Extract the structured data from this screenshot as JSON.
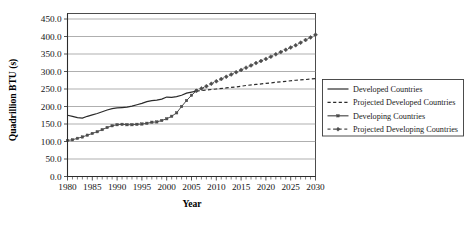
{
  "chart_data": {
    "type": "line",
    "title": "",
    "xlabel": "Year",
    "ylabel": "Quadrillion BTU (s)",
    "xlim": [
      1980,
      2030
    ],
    "ylim": [
      0,
      450
    ],
    "ytick_step": 50,
    "xtick_step": 5,
    "grid": true,
    "minor_xticks": true,
    "legend_position": "right",
    "xticks": [
      "1980",
      "1985",
      "1990",
      "1995",
      "2000",
      "2005",
      "2010",
      "2015",
      "2020",
      "2025",
      "2030"
    ],
    "yticks": [
      "0.0",
      "50.0",
      "100.0",
      "150.0",
      "200.0",
      "250.0",
      "300.0",
      "350.0",
      "400.0",
      "450.0"
    ],
    "series": [
      {
        "name": "Developed Countries",
        "style": "solid",
        "marker": "none",
        "color": "#2b2b2b",
        "x": [
          1980,
          1981,
          1982,
          1983,
          1984,
          1985,
          1986,
          1987,
          1988,
          1989,
          1990,
          1991,
          1992,
          1993,
          1994,
          1995,
          1996,
          1997,
          1998,
          1999,
          2000,
          2001,
          2002,
          2003,
          2004,
          2005,
          2006
        ],
        "values": [
          175,
          172,
          168,
          167,
          172,
          176,
          180,
          185,
          190,
          194,
          196,
          197,
          198,
          201,
          205,
          209,
          214,
          217,
          218,
          221,
          227,
          226,
          228,
          232,
          238,
          241,
          244
        ]
      },
      {
        "name": "Projected Developed Countries",
        "style": "dashed",
        "marker": "none",
        "color": "#2b2b2b",
        "x": [
          2006,
          2008,
          2010,
          2012,
          2014,
          2016,
          2018,
          2020,
          2022,
          2024,
          2026,
          2028,
          2030
        ],
        "values": [
          244,
          247,
          250,
          253,
          256,
          260,
          263,
          266,
          269,
          272,
          275,
          277,
          280
        ]
      },
      {
        "name": "Developing Countries",
        "style": "solid",
        "marker": "square",
        "color": "#4d4d4d",
        "x": [
          1980,
          1981,
          1982,
          1983,
          1984,
          1985,
          1986,
          1987,
          1988,
          1989,
          1990,
          1991,
          1992,
          1993,
          1994,
          1995,
          1996,
          1997,
          1998,
          1999,
          2000,
          2001,
          2002,
          2003,
          2004,
          2005,
          2006
        ],
        "values": [
          103,
          105,
          109,
          113,
          118,
          123,
          128,
          134,
          140,
          145,
          148,
          149,
          148,
          148,
          149,
          150,
          152,
          155,
          156,
          160,
          165,
          172,
          182,
          200,
          217,
          232,
          245
        ]
      },
      {
        "name": "Projected Developing Countries",
        "style": "dash-dot",
        "marker": "diamond",
        "color": "#4d4d4d",
        "x": [
          2006,
          2008,
          2010,
          2012,
          2014,
          2016,
          2018,
          2020,
          2022,
          2024,
          2026,
          2028,
          2030
        ],
        "values": [
          245,
          258,
          272,
          285,
          298,
          311,
          324,
          336,
          349,
          362,
          375,
          390,
          405
        ]
      }
    ]
  },
  "legend": {
    "items": [
      {
        "label": "Developed Countries"
      },
      {
        "label": "Projected Developed Countries"
      },
      {
        "label": "Developing Countries"
      },
      {
        "label": "Projected Developing Countries"
      }
    ]
  }
}
